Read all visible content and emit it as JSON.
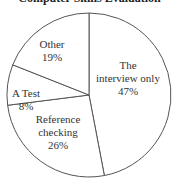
{
  "chart_data": {
    "type": "pie",
    "title": "Computer Skills Evaluation",
    "categories": [
      "The interview only",
      "Reference checking",
      "A Test",
      "Other"
    ],
    "values": [
      47,
      26,
      8,
      19
    ],
    "labels": [
      {
        "lines": [
          "The",
          "interview only",
          "47%"
        ]
      },
      {
        "lines": [
          "Reference",
          "checking",
          "26%"
        ]
      },
      {
        "lines": [
          "A Test",
          "8%"
        ]
      },
      {
        "lines": [
          "Other",
          "19%"
        ]
      }
    ],
    "start_angle_deg": 0,
    "direction": "clockwise",
    "fill_color": "#ffffff",
    "stroke_color": "#555555"
  }
}
